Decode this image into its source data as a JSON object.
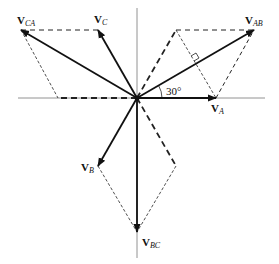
{
  "diagram": {
    "angle_label": "30°",
    "vectors": [
      {
        "id": "VA",
        "main": "V",
        "sub": "A",
        "type": "phase",
        "angle_deg": 0
      },
      {
        "id": "VB",
        "main": "V",
        "sub": "B",
        "type": "phase",
        "angle_deg": -120
      },
      {
        "id": "VC",
        "main": "V",
        "sub": "C",
        "type": "phase",
        "angle_deg": 120
      },
      {
        "id": "VAB",
        "main": "V",
        "sub": "AB",
        "type": "line",
        "angle_deg": 30
      },
      {
        "id": "VBC",
        "main": "V",
        "sub": "BC",
        "type": "line",
        "angle_deg": -90
      },
      {
        "id": "VCA",
        "main": "V",
        "sub": "CA",
        "type": "line",
        "angle_deg": 150
      }
    ]
  }
}
